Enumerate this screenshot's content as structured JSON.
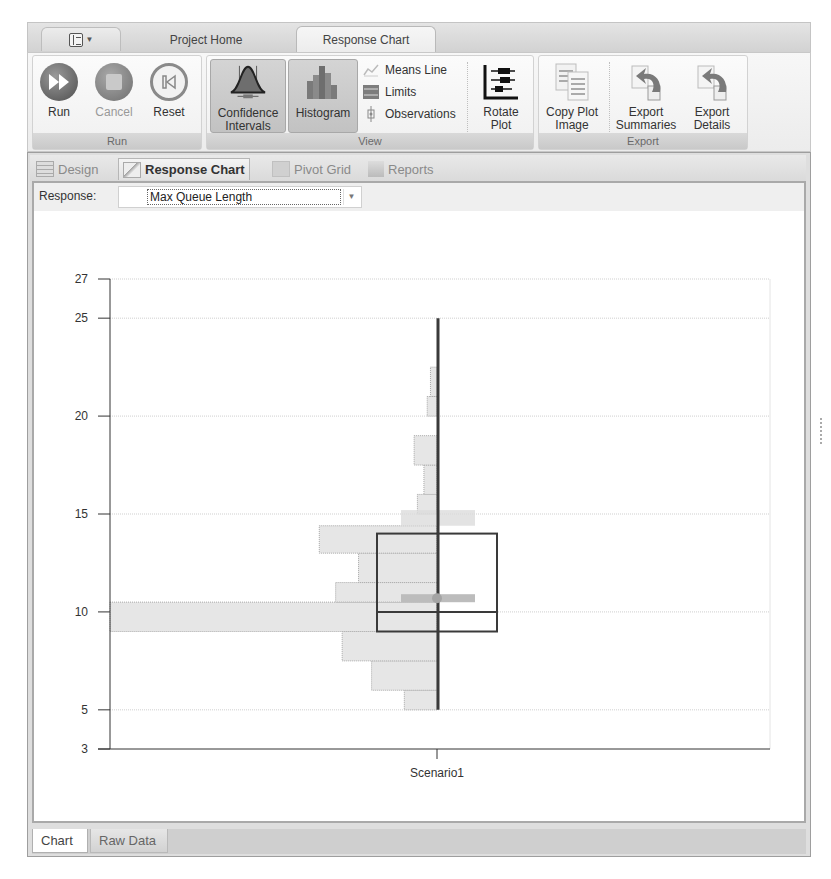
{
  "ribbon": {
    "app_menu": {
      "icon": "app-menu-icon"
    },
    "tabs": [
      {
        "label": "Project Home",
        "active": false
      },
      {
        "label": "Response Chart",
        "active": true
      }
    ],
    "groups": {
      "run": {
        "label": "Run",
        "buttons": [
          {
            "label": "Run",
            "icon": "run-icon",
            "enabled": true
          },
          {
            "label": "Cancel",
            "icon": "cancel-icon",
            "enabled": false
          },
          {
            "label": "Reset",
            "icon": "reset-icon",
            "enabled": true
          }
        ]
      },
      "view": {
        "label": "View",
        "confidence": {
          "label1": "Confidence",
          "label2": "Intervals",
          "active": true
        },
        "histogram": {
          "label": "Histogram",
          "active": true
        },
        "means_line": "Means Line",
        "limits": "Limits",
        "observations": "Observations",
        "rotate": {
          "label1": "Rotate",
          "label2": "Plot"
        }
      },
      "export": {
        "label": "Export",
        "copy": {
          "label1": "Copy Plot",
          "label2": "Image"
        },
        "summaries": {
          "label1": "Export",
          "label2": "Summaries"
        },
        "details": {
          "label1": "Export",
          "label2": "Details"
        }
      }
    }
  },
  "doc_tabs": [
    {
      "label": "Design",
      "active": false
    },
    {
      "label": "Response Chart",
      "active": true
    },
    {
      "label": "Pivot Grid",
      "active": false
    },
    {
      "label": "Reports",
      "active": false
    }
  ],
  "response": {
    "label": "Response:",
    "value": "Max Queue Length"
  },
  "bottom_tabs": [
    {
      "label": "Chart",
      "active": true
    },
    {
      "label": "Raw Data",
      "active": false
    }
  ],
  "colors": {
    "hist_fill": "#e6e6e6",
    "hist_stroke": "#a8a8a8",
    "box_stroke": "#3a3a3a",
    "whisker": "#3a3a3a",
    "mean_band": "#bcbcbc",
    "ci_band": "#dcdcdc"
  },
  "chart_data": {
    "type": "box-histogram",
    "title": "",
    "xlabel": "",
    "ylabel": "",
    "categories": [
      "Scenario1"
    ],
    "yticks": [
      3,
      5,
      10,
      15,
      20,
      25,
      27
    ],
    "ylim": [
      3,
      27
    ],
    "grid": true,
    "box": {
      "category": "Scenario1",
      "min": 5,
      "q1": 9,
      "median": 10,
      "q3": 14,
      "max": 25,
      "mean": 10.7
    },
    "mean_confidence_interval": [
      10.3,
      10.5
    ],
    "median_band": [
      9,
      10.4
    ],
    "upper_band": [
      14.4,
      15.2
    ],
    "histogram_bins": [
      {
        "from": 5,
        "to": 6,
        "relative_width": 0.1
      },
      {
        "from": 6,
        "to": 7.5,
        "relative_width": 0.2
      },
      {
        "from": 7.5,
        "to": 9,
        "relative_width": 0.29
      },
      {
        "from": 9,
        "to": 10.5,
        "relative_width": 1.0
      },
      {
        "from": 10.5,
        "to": 11.5,
        "relative_width": 0.31
      },
      {
        "from": 11.5,
        "to": 13,
        "relative_width": 0.24
      },
      {
        "from": 13,
        "to": 14.4,
        "relative_width": 0.36
      },
      {
        "from": 15,
        "to": 16,
        "relative_width": 0.06
      },
      {
        "from": 16,
        "to": 17.5,
        "relative_width": 0.04
      },
      {
        "from": 17.5,
        "to": 19,
        "relative_width": 0.07
      },
      {
        "from": 20,
        "to": 21,
        "relative_width": 0.03
      },
      {
        "from": 21,
        "to": 22.5,
        "relative_width": 0.02
      }
    ]
  }
}
